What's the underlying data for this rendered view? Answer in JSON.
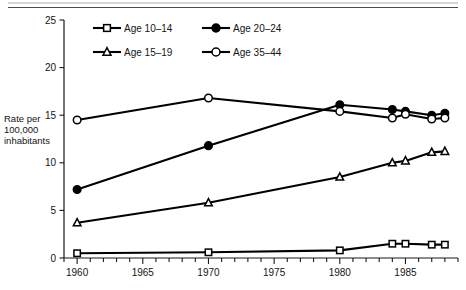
{
  "figure": {
    "has_top_rule": true,
    "axis_label_lines": [
      "Rate per",
      "100,000",
      "inhabitants"
    ]
  },
  "chart_data": {
    "type": "line",
    "title": "",
    "xlabel": "",
    "ylabel": "Rate per 100,000 inhabitants",
    "xlim": [
      1959,
      1989
    ],
    "ylim": [
      0,
      25
    ],
    "yticks": [
      0,
      5,
      10,
      15,
      20,
      25
    ],
    "xticks_major": [
      1960,
      1965,
      1970,
      1975,
      1980,
      1985
    ],
    "xtick_labels": [
      "1960",
      "1965",
      "1970",
      "1975",
      "1980",
      "1985"
    ],
    "xticks_minor_step": 1,
    "grid": false,
    "legend_position": "upper-center",
    "x": [
      1960,
      1970,
      1980,
      1984,
      1985,
      1987,
      1988
    ],
    "series": [
      {
        "name": "Age 10–14",
        "marker": "open-square",
        "values": [
          0.5,
          0.6,
          0.8,
          1.5,
          1.5,
          1.4,
          1.4
        ]
      },
      {
        "name": "Age 20–24",
        "marker": "filled-circle",
        "values": [
          7.2,
          11.8,
          16.1,
          15.6,
          15.4,
          15.0,
          15.2
        ]
      },
      {
        "name": "Age 15–19",
        "marker": "open-triangle",
        "values": [
          3.7,
          5.8,
          8.5,
          10.0,
          10.2,
          11.1,
          11.2
        ]
      },
      {
        "name": "Age 35–44",
        "marker": "open-circle",
        "values": [
          14.5,
          16.8,
          15.4,
          14.7,
          15.1,
          14.6,
          14.7
        ]
      }
    ]
  },
  "legend": {
    "entries": [
      {
        "label": "Age 10–14",
        "marker": "open-square"
      },
      {
        "label": "Age 20–24",
        "marker": "filled-circle"
      },
      {
        "label": "Age 15–19",
        "marker": "open-triangle"
      },
      {
        "label": "Age 35–44",
        "marker": "open-circle"
      }
    ]
  },
  "ytick_labels": [
    "0",
    "5",
    "10",
    "15",
    "20",
    "25"
  ]
}
